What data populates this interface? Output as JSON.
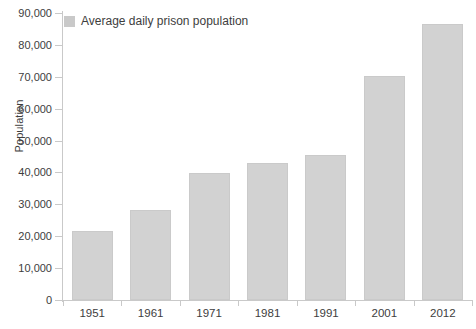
{
  "chart_data": {
    "type": "bar",
    "title": "",
    "subtitle": "",
    "xlabel": "",
    "ylabel": "Population",
    "categories": [
      "1951",
      "1961",
      "1971",
      "1981",
      "1991",
      "2001",
      "2012"
    ],
    "values": [
      21500,
      28200,
      39700,
      42900,
      45500,
      70200,
      86600
    ],
    "series": [
      {
        "name": "Average daily prison population",
        "values": [
          21500,
          28200,
          39700,
          42900,
          45500,
          70200,
          86600
        ],
        "color": "#d2d2d2"
      }
    ],
    "ylim": [
      0,
      90000
    ],
    "ytick_values": [
      0,
      10000,
      20000,
      30000,
      40000,
      50000,
      60000,
      70000,
      80000,
      90000
    ],
    "ytick_labels": [
      "0",
      "10,000",
      "20,000",
      "30,000",
      "40,000",
      "50,000",
      "60,000",
      "70,000",
      "80,000",
      "90,000"
    ],
    "grid": false,
    "legend_position": "top-left",
    "legend": [
      "Average daily prison population"
    ]
  },
  "legend": {
    "label": "Average daily prison population",
    "swatch_color": "#c9c9c9"
  },
  "axes": {
    "y_title": "Population",
    "axis_color": "#c9c9c9",
    "tick_text_color": "#3d3d3d"
  }
}
